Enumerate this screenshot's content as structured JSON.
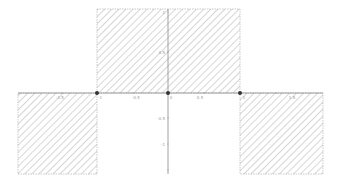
{
  "figure": {
    "colors": {
      "hatch": "#b4b4b4",
      "region_border": "#9a9a9a",
      "axis": "#8a8a8a",
      "point": "#333333",
      "background": "#ffffff"
    }
  },
  "axes": {
    "x_ticks": [
      {
        "value": -1.5,
        "label": "-1.5"
      },
      {
        "value": -1,
        "label": "-1"
      },
      {
        "value": -0.5,
        "label": "-0.5"
      },
      {
        "value": 0,
        "label": "0"
      },
      {
        "value": 0.5,
        "label": "0.5"
      },
      {
        "value": 1,
        "label": "1"
      },
      {
        "value": 1.5,
        "label": "1.5"
      }
    ],
    "y_ticks": [
      {
        "value": 1,
        "label": "1"
      },
      {
        "value": 0.5,
        "label": "0.5"
      },
      {
        "value": -0.5,
        "label": "-0.5"
      },
      {
        "value": -1,
        "label": "-1"
      }
    ]
  },
  "regions": [
    {
      "name": "upper-middle",
      "x_from": -1,
      "x_to": 1,
      "side": "above"
    },
    {
      "name": "lower-left",
      "x_from": -2.1,
      "x_to": -1,
      "side": "below"
    },
    {
      "name": "lower-right",
      "x_from": 1,
      "x_to": 2.1,
      "side": "below"
    }
  ],
  "points": [
    {
      "x": -1,
      "y": 0
    },
    {
      "x": 0,
      "y": 0
    },
    {
      "x": 1,
      "y": 0
    }
  ]
}
